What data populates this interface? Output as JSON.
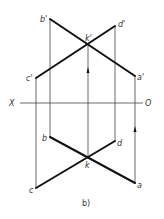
{
  "diagram": {
    "caption": "b)",
    "axis": {
      "left_label": "X",
      "right_label": "O",
      "y": 103,
      "x1": 20,
      "x2": 143
    },
    "front_view": {
      "points": {
        "b_prime": {
          "label": "b'",
          "x": 50,
          "y": 19
        },
        "d_prime": {
          "label": "d'",
          "x": 115,
          "y": 26
        },
        "k_prime": {
          "label": "k'",
          "x": 88,
          "y": 45
        },
        "c_prime": {
          "label": "c'",
          "x": 36,
          "y": 78
        },
        "a_prime": {
          "label": "a'",
          "x": 135,
          "y": 76
        }
      },
      "lines": [
        [
          "b_prime",
          "a_prime"
        ],
        [
          "c_prime",
          "d_prime"
        ]
      ]
    },
    "top_view": {
      "points": {
        "b": {
          "label": "b",
          "x": 50,
          "y": 137
        },
        "d": {
          "label": "d",
          "x": 115,
          "y": 141
        },
        "k": {
          "label": "k",
          "x": 88,
          "y": 158
        },
        "c": {
          "label": "c",
          "x": 36,
          "y": 188
        },
        "a": {
          "label": "a",
          "x": 135,
          "y": 183
        }
      },
      "lines": [
        [
          "b",
          "a"
        ],
        [
          "c",
          "d"
        ]
      ]
    },
    "arrows": [
      {
        "x": 88,
        "y": 71,
        "direction": "up"
      },
      {
        "x": 135,
        "y": 130,
        "direction": "up"
      }
    ]
  }
}
